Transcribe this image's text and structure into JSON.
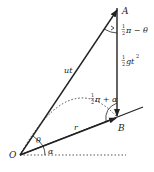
{
  "diagram": {
    "type": "projectile-on-inclined-plane",
    "points": {
      "O": {
        "label": "O"
      },
      "A": {
        "label": "A"
      },
      "B": {
        "label": "B"
      }
    },
    "segments": {
      "OA": {
        "label": "ut"
      },
      "AB": {
        "label_frac": "1/2",
        "label_rest": "gt",
        "label_exp": "2"
      },
      "OB": {
        "label": "r"
      }
    },
    "angles": {
      "theta": {
        "label": "θ"
      },
      "alpha": {
        "label": "α"
      },
      "at_A": {
        "label_frac": "1/2",
        "label_rest": "π − θ"
      },
      "at_B": {
        "label_frac": "1/2",
        "label_rest": "π + α"
      }
    },
    "colors": {
      "line": "#222222",
      "dotted": "#444444"
    }
  }
}
